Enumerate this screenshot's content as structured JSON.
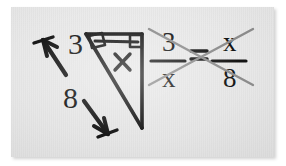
{
  "figure": {
    "kind": "handwritten-math-diagram",
    "background_color": "#e8e8e8",
    "ink_color": "#141414",
    "crossmultiply_color": "#8c8c8c",
    "caption": "Right triangle with altitude, geometric mean proportion 3/x = x/8 solved by cross multiplication"
  },
  "left_panel": {
    "name": "arrow-pair-with-lengths",
    "arrow_up": {
      "name": "arrow-up-left",
      "direction": "up-left",
      "label": "3"
    },
    "arrow_down": {
      "name": "arrow-down-right",
      "direction": "down-right",
      "label": "8"
    },
    "labels": {
      "upper": "3",
      "lower": "8"
    }
  },
  "triangle": {
    "name": "right-triangle-with-altitude",
    "interior_label": "x",
    "right_angle_marks": 2,
    "marks": [
      {
        "name": "right-angle-mark-apex",
        "position": "upper-left"
      },
      {
        "name": "right-angle-mark-corner",
        "position": "upper-right"
      }
    ]
  },
  "equation": {
    "name": "proportion-equation",
    "left_fraction": {
      "numerator": "3",
      "denominator": "x"
    },
    "operator": "=",
    "right_fraction": {
      "numerator": "x",
      "denominator": "8"
    },
    "cross_multiply": {
      "name": "cross-multiply-x",
      "shown": true,
      "stroke_color": "#8c8c8c"
    },
    "plain_text": "3/x = x/8"
  }
}
